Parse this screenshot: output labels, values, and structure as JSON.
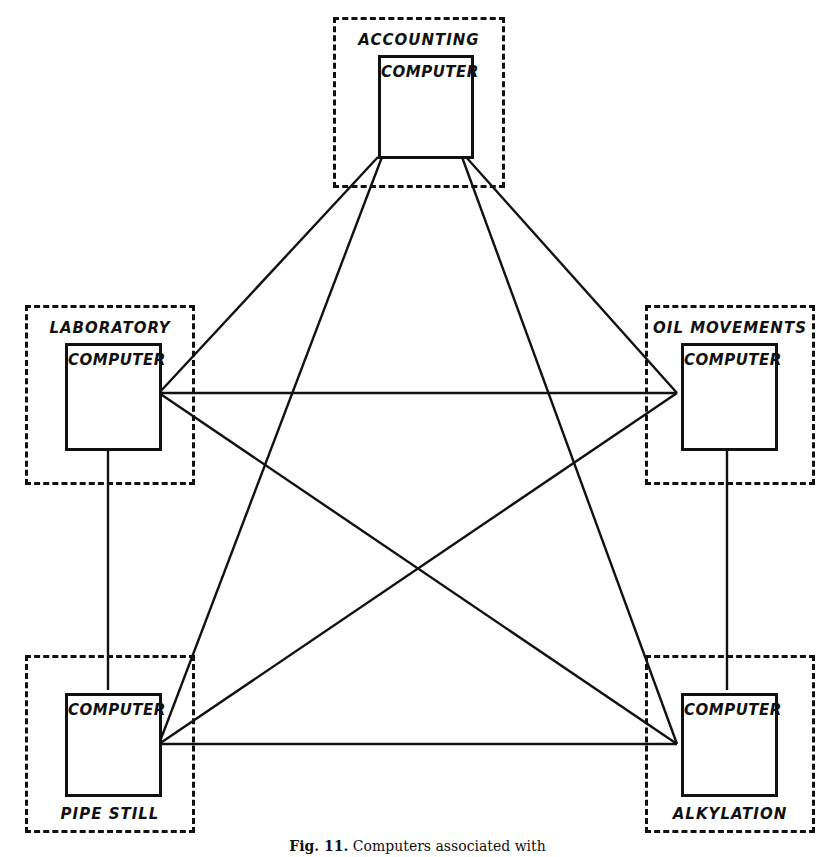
{
  "figure": {
    "caption_label": "Fig. 11.",
    "caption_text": "Computers associated with",
    "box_text": "COMPUTER"
  },
  "nodes": [
    {
      "id": "accounting",
      "label": "ACCOUNTING",
      "box_text": "COMPUTER",
      "label_position": "above",
      "outer": {
        "x": 333,
        "y": 17,
        "w": 172,
        "h": 171
      },
      "inner": {
        "x": 375,
        "y": 52,
        "w": 96,
        "h": 104
      }
    },
    {
      "id": "laboratory",
      "label": "LABORATORY",
      "box_text": "COMPUTER",
      "label_position": "above",
      "outer": {
        "x": 25,
        "y": 305,
        "w": 170,
        "h": 180
      },
      "inner": {
        "x": 62,
        "y": 340,
        "w": 97,
        "h": 108
      }
    },
    {
      "id": "oil-movements",
      "label": "OIL MOVEMENTS",
      "box_text": "COMPUTER",
      "label_position": "above",
      "outer": {
        "x": 645,
        "y": 305,
        "w": 170,
        "h": 180
      },
      "inner": {
        "x": 678,
        "y": 340,
        "w": 97,
        "h": 108
      }
    },
    {
      "id": "pipe-still",
      "label": "PIPE STILL",
      "box_text": "COMPUTER",
      "label_position": "below",
      "outer": {
        "x": 25,
        "y": 655,
        "w": 170,
        "h": 178
      },
      "inner": {
        "x": 62,
        "y": 690,
        "w": 97,
        "h": 104
      }
    },
    {
      "id": "alkylation",
      "label": "ALKYLATION",
      "box_text": "COMPUTER",
      "label_position": "below",
      "outer": {
        "x": 645,
        "y": 655,
        "w": 170,
        "h": 178
      },
      "inner": {
        "x": 678,
        "y": 690,
        "w": 97,
        "h": 104
      }
    }
  ],
  "connections": [
    {
      "from": "accounting",
      "to": "laboratory",
      "x1": 378,
      "y1": 157,
      "x2": 159,
      "y2": 393
    },
    {
      "from": "accounting",
      "to": "pipe-still",
      "x1": 382,
      "y1": 157,
      "x2": 159,
      "y2": 744
    },
    {
      "from": "accounting",
      "to": "oil-movements",
      "x1": 466,
      "y1": 157,
      "x2": 677,
      "y2": 393
    },
    {
      "from": "accounting",
      "to": "alkylation",
      "x1": 462,
      "y1": 157,
      "x2": 677,
      "y2": 744
    },
    {
      "from": "laboratory",
      "to": "oil-movements",
      "x1": 159,
      "y1": 393,
      "x2": 677,
      "y2": 393
    },
    {
      "from": "laboratory",
      "to": "alkylation",
      "x1": 159,
      "y1": 393,
      "x2": 677,
      "y2": 744
    },
    {
      "from": "oil-movements",
      "to": "pipe-still",
      "x1": 677,
      "y1": 393,
      "x2": 159,
      "y2": 744
    },
    {
      "from": "pipe-still",
      "to": "alkylation",
      "x1": 159,
      "y1": 744,
      "x2": 677,
      "y2": 744
    },
    {
      "from": "laboratory",
      "to": "pipe-still",
      "x1": 108,
      "y1": 448,
      "x2": 108,
      "y2": 690
    },
    {
      "from": "oil-movements",
      "to": "alkylation",
      "x1": 727,
      "y1": 448,
      "x2": 727,
      "y2": 690
    }
  ],
  "style": {
    "line_color": "#111111",
    "background": "#ffffff"
  }
}
